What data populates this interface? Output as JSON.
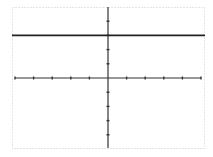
{
  "chart_data": {
    "type": "line",
    "title": "",
    "xlabel": "",
    "ylabel": "",
    "xlim": [
      -5,
      5
    ],
    "ylim": [
      -5,
      5
    ],
    "x_ticks": [
      -5,
      -4,
      -3,
      -2,
      -1,
      0,
      1,
      2,
      3,
      4,
      5
    ],
    "y_ticks": [
      -4,
      -3,
      -2,
      -1,
      0,
      1,
      2,
      3,
      4
    ],
    "tick_labels_shown": false,
    "grid": false,
    "legend": null,
    "series": [
      {
        "name": "y = 3",
        "x": [
          -5.2,
          5.2
        ],
        "y": [
          3,
          3
        ]
      }
    ]
  },
  "colors": {
    "axis": "#333333",
    "line": "#222222",
    "frame": "#c8c8c8",
    "background": "#ffffff"
  }
}
